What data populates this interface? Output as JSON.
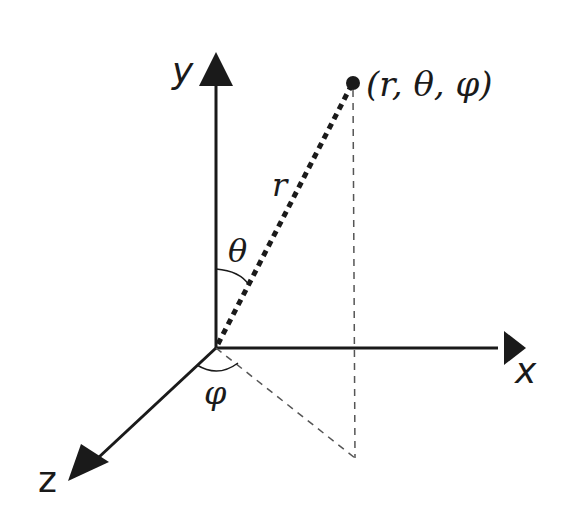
{
  "diagram": {
    "colors": {
      "stroke": "#1a1a1a",
      "background": "#ffffff",
      "dashed": "#555555"
    },
    "axes": [
      {
        "name": "y",
        "label": "y"
      },
      {
        "name": "x",
        "label": "x"
      },
      {
        "name": "z",
        "label": "z"
      }
    ],
    "point": {
      "label": "(r, θ, φ)"
    },
    "radius": {
      "label": "r"
    },
    "angles": {
      "polar": {
        "label": "θ"
      },
      "azimuthal": {
        "label": "φ"
      }
    }
  }
}
